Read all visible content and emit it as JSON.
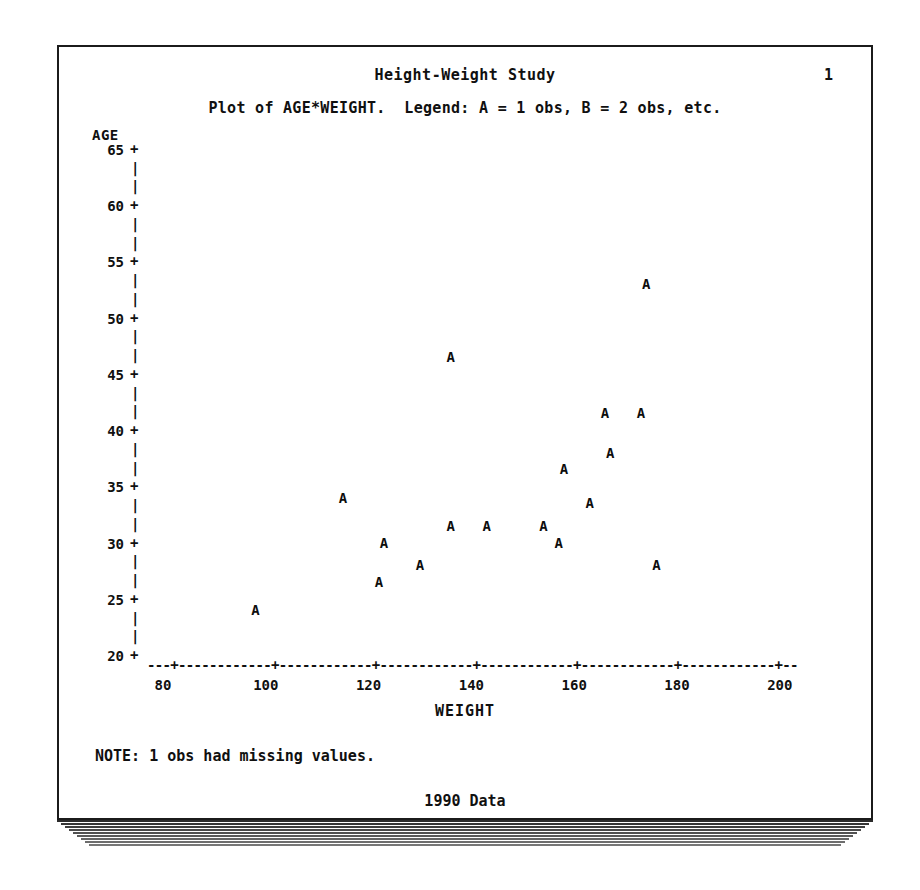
{
  "report": {
    "title": "Height-Weight Study",
    "page_number": "1",
    "subtitle": "Plot of AGE*WEIGHT.  Legend: A = 1 obs, B = 2 obs, etc.",
    "note": "NOTE: 1 obs had missing values.",
    "footnote": "1990 Data",
    "ink_color": "#101010",
    "paper_color": "#ffffff"
  },
  "chart_data": {
    "type": "scatter",
    "title": "Height-Weight Study",
    "subtitle": "Plot of AGE*WEIGHT.  Legend: A = 1 obs, B = 2 obs, etc.",
    "xlabel": "WEIGHT",
    "ylabel": "AGE",
    "xlim": [
      75,
      205
    ],
    "ylim": [
      20,
      65
    ],
    "xticks": [
      80,
      100,
      120,
      140,
      160,
      180,
      200
    ],
    "yticks": [
      20,
      25,
      30,
      35,
      40,
      45,
      50,
      55,
      60,
      65
    ],
    "xtick_labels": [
      "80",
      "100",
      "120",
      "140",
      "160",
      "180",
      "200"
    ],
    "ytick_labels": [
      "20",
      "25",
      "30",
      "35",
      "40",
      "45",
      "50",
      "55",
      "60",
      "65"
    ],
    "grid": false,
    "legend": "A = 1 obs, B = 2 obs, etc.",
    "point_marker": "A",
    "legend_position": "subtitle",
    "missing_obs": 1,
    "n_points": 17,
    "points": [
      {
        "marker": "A",
        "x": 98,
        "y": 24.0
      },
      {
        "marker": "A",
        "x": 115,
        "y": 34.0
      },
      {
        "marker": "A",
        "x": 122,
        "y": 26.5
      },
      {
        "marker": "A",
        "x": 123,
        "y": 30.0
      },
      {
        "marker": "A",
        "x": 130,
        "y": 28.0
      },
      {
        "marker": "A",
        "x": 136,
        "y": 31.5
      },
      {
        "marker": "A",
        "x": 136,
        "y": 46.5
      },
      {
        "marker": "A",
        "x": 143,
        "y": 31.5
      },
      {
        "marker": "A",
        "x": 154,
        "y": 31.5
      },
      {
        "marker": "A",
        "x": 157,
        "y": 30.0
      },
      {
        "marker": "A",
        "x": 158,
        "y": 36.5
      },
      {
        "marker": "A",
        "x": 163,
        "y": 33.5
      },
      {
        "marker": "A",
        "x": 166,
        "y": 41.5
      },
      {
        "marker": "A",
        "x": 167,
        "y": 38.0
      },
      {
        "marker": "A",
        "x": 173,
        "y": 41.5
      },
      {
        "marker": "A",
        "x": 174,
        "y": 53.0
      },
      {
        "marker": "A",
        "x": 176,
        "y": 28.0
      }
    ]
  },
  "axis_render": {
    "x_axis_rule": "---+------------+------------+------------+------------+------------+------------+--",
    "tick_glyph": "+",
    "vertical_dash_glyph": "|"
  }
}
